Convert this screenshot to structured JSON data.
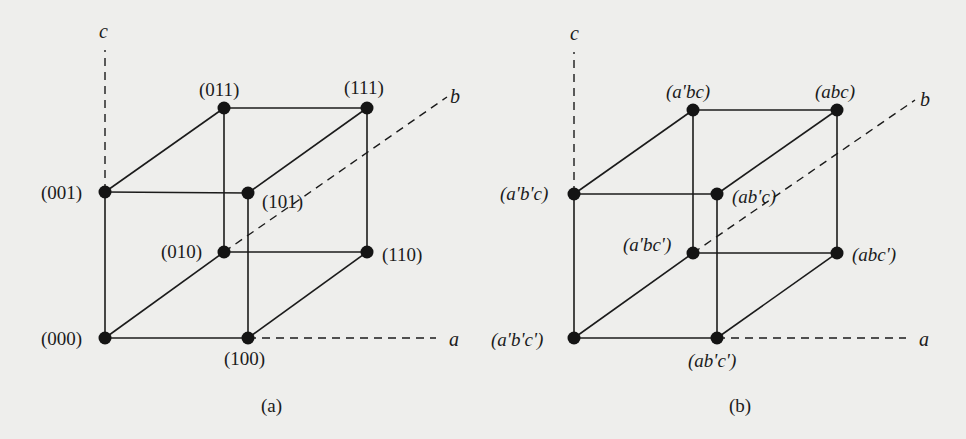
{
  "figure": {
    "background": "#eeeeec",
    "ink": "#1b1b1b",
    "panels": [
      {
        "id": "a",
        "caption": "(a)",
        "axes": {
          "a": "a",
          "b": "b",
          "c": "c"
        },
        "vertices": {
          "000": "(000)",
          "100": "(100)",
          "010": "(010)",
          "110": "(110)",
          "001": "(001)",
          "101": "(101)",
          "011": "(011)",
          "111": "(111)"
        }
      },
      {
        "id": "b",
        "caption": "(b)",
        "axes": {
          "a": "a",
          "b": "b",
          "c": "c"
        },
        "vertices": {
          "000": "(a'b'c')",
          "100": "(ab'c')",
          "010": "(a'bc')",
          "110": "(abc')",
          "001": "(a'b'c)",
          "101": "(ab'c)",
          "011": "(a'bc)",
          "111": "(abc)"
        }
      }
    ]
  }
}
